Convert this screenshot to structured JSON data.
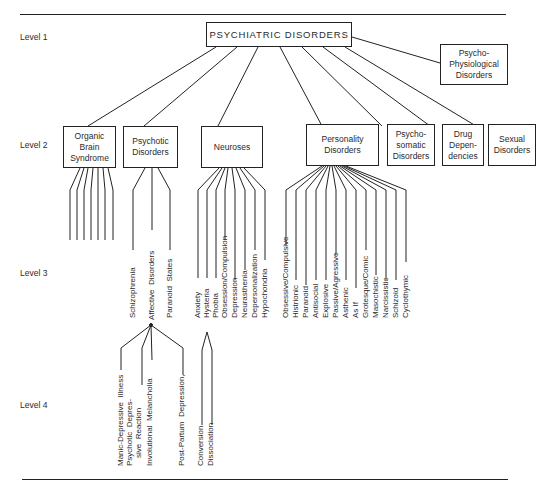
{
  "levels": [
    "Level 1",
    "Level 2",
    "Level 3",
    "Level 4"
  ],
  "root": "PSYCHIATRIC DISORDERS",
  "level1_side": "Psycho-\nPhysiological\nDisorders",
  "level2": [
    {
      "label": "Organic\nBrain\nSyndrome"
    },
    {
      "label": "Psychotic\nDisorders"
    },
    {
      "label": "Neuroses"
    },
    {
      "label": "Personality\nDisorders"
    },
    {
      "label": "Psycho-\nsomatic\nDisorders"
    },
    {
      "label": "Drug\nDepen-\ndencies"
    },
    {
      "label": "Sexual\nDisorders"
    }
  ],
  "psychotic_children": [
    "Schizophrenia",
    "Affective  Disorders",
    "Paranoid  States"
  ],
  "neuroses_children": [
    "Anxiety",
    "Hysteria",
    "Phobia",
    "Obsession/Compulsion",
    "Depression",
    "Neurasthenia",
    "Depersonalization",
    "Hypochondria"
  ],
  "personality_children": [
    "Obsessive/Compulsive",
    "Histrionic",
    "Paranoid",
    "Antisocial",
    "Explosive",
    "Passive/Agressive",
    "Asthenic",
    "As If",
    "Grotesque/Comic",
    "Masochistic",
    "Narcissistic",
    "Schizoid",
    "Cyclothymic"
  ],
  "affective_children": [
    "Manic-Depressive  Illness",
    "Psychotic  Depres-",
    "sive  Reaction",
    "Involutional  Melancholia",
    "Post-Partum  Depression,"
  ],
  "hysteria_children": [
    "Conversion",
    "Dissociation"
  ]
}
